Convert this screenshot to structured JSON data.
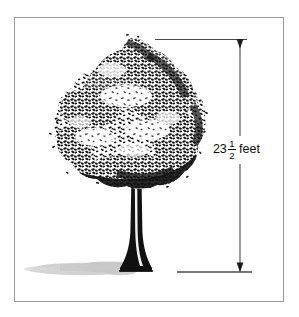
{
  "figure": {
    "title": "Tree height measurement diagram",
    "background_color": "#ffffff",
    "frame": {
      "name": "illustration-border",
      "color": "#9a9a9a",
      "x": 14,
      "y": 17,
      "width": 270,
      "height": 285
    }
  },
  "dimension": {
    "label_whole": "23",
    "label_numerator": "1",
    "label_denominator": "2",
    "label_unit": "feet",
    "full_text": "23 1/2 feet",
    "value": 23.5,
    "unit": "feet",
    "line_color": "#3a3a3a",
    "axis_x": 240,
    "top_y": 39,
    "bottom_y": 272,
    "top_extension": {
      "x1": 155,
      "x2": 247,
      "y": 39
    },
    "bottom_extension": {
      "x1": 177,
      "x2": 252,
      "y": 272
    },
    "arrow_top_direction": "down",
    "arrow_bottom_direction": "down"
  },
  "tree": {
    "name": "deciduous-tree",
    "canopy": {
      "color": "#111111",
      "style": "stippled-foliage",
      "left": 52,
      "right": 206,
      "top": 38,
      "bottom": 188,
      "apex_x": 132
    },
    "trunk": {
      "color": "#111111",
      "highlight_color": "#ffffff",
      "top_y": 150,
      "base_y": 272,
      "center_x": 136,
      "top_width": 9,
      "base_width": 20
    },
    "shadow": {
      "color": "#c9c9c9",
      "left": 28,
      "right": 133,
      "top": 261,
      "bottom": 276
    }
  }
}
